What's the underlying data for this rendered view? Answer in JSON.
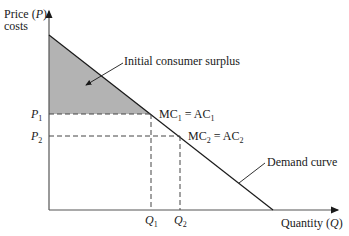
{
  "diagram": {
    "y_axis_label_line1": "Price (",
    "y_axis_label_var": "P",
    "y_axis_label_close": ")",
    "y_axis_label_line2": "costs",
    "x_axis_label": "Quantity (",
    "x_axis_label_var": "Q",
    "x_axis_label_close": ")",
    "p1": {
      "letter": "P",
      "sub": "1"
    },
    "p2": {
      "letter": "P",
      "sub": "2"
    },
    "q1": {
      "letter": "Q",
      "sub": "1"
    },
    "q2": {
      "letter": "Q",
      "sub": "2"
    },
    "point1": {
      "a": "MC",
      "a_sub": "1",
      "eq": " = ",
      "b": "AC",
      "b_sub": "1"
    },
    "point2": {
      "a": "MC",
      "a_sub": "2",
      "eq": " = ",
      "b": "AC",
      "b_sub": "2"
    },
    "consumer_surplus_label": "Initial consumer surplus",
    "demand_label": "Demand curve",
    "colors": {
      "surplus_fill": "#b3b3b3",
      "line": "#1a1a1a",
      "axis": "#555555"
    }
  }
}
